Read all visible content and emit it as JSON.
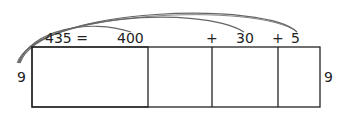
{
  "equation": {
    "total": "435 =",
    "hundreds": "400",
    "plus1": "+",
    "tens": "30",
    "plus2": "+",
    "ones": "5"
  },
  "side_labels": {
    "left": "9",
    "right": "9"
  },
  "colors": {
    "stroke": "#333333",
    "arc": "#555555"
  }
}
